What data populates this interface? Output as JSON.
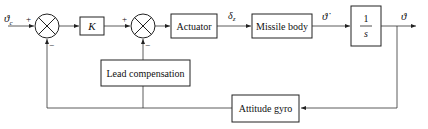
{
  "diagram": {
    "type": "control-block-diagram",
    "input_label": "ϑc",
    "output_label": "ϑ",
    "signals": {
      "delta_z": "δz",
      "theta_dot": "ϑ̇"
    },
    "blocks": {
      "gain": "K",
      "actuator": "Actuator",
      "missile_body": "Missile body",
      "integrator_num": "1",
      "integrator_den": "s",
      "lead_compensation": "Lead compensation",
      "attitude_gyro": "Attitude gyro"
    },
    "signs": {
      "sum1_plus": "+",
      "sum1_minus": "−",
      "sum2_plus": "+",
      "sum2_minus": "−"
    },
    "colors": {
      "line": "#333333",
      "background": "#ffffff"
    }
  }
}
